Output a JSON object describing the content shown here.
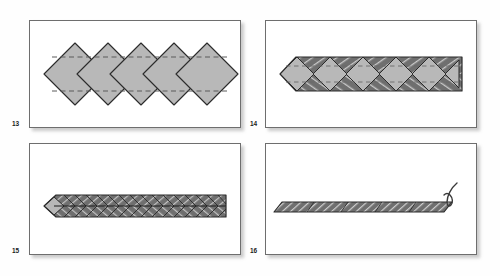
{
  "document": {
    "type": "origami-folding-instruction-diagram",
    "title": "",
    "background_color": "#fdfdfd"
  },
  "palette": {
    "paper_face": "#b8b8b8",
    "paper_face_light": "#c3c3c3",
    "paper_shadow": "#8f8f8f",
    "hatch_dark": "#6f6f6f",
    "hatch_line": "#2b2b2b",
    "outline": "#2b2b2b",
    "frame_border": "#6e6e6e",
    "frame_fill": "#ffffff",
    "fold_line": "#5a5a5a",
    "annotation_ink": "#3a3a3a"
  },
  "panels": [
    {
      "id": "panel-13",
      "number": "13",
      "caption": "",
      "content_name": "diamond-strip-unfolded",
      "description_shape": "row of five overlapping squares rotated 45 degrees with two horizontal dashed fold lines",
      "unit_count": 5,
      "fold_lines": 2,
      "fold_line_style": "dashed",
      "fill_color": "#b8b8b8",
      "outline_color": "#2b2b2b"
    },
    {
      "id": "panel-14",
      "number": "14",
      "caption": "",
      "content_name": "diamond-strip-edges-folded",
      "description_shape": "same strip with top and bottom corners folded inward showing dark hatched flaps",
      "unit_count": 5,
      "fold_lines": 2,
      "fold_line_style": "dashed",
      "fill_color": "#b8b8b8",
      "hatch_color": "#6f6f6f",
      "outline_color": "#2b2b2b"
    },
    {
      "id": "panel-15",
      "number": "15",
      "caption": "",
      "content_name": "chevron-strip-folded",
      "description_shape": "narrow horizontal band of chevron shaped hatched segments with pointed left tip",
      "unit_count": 5,
      "chevrons_per_unit": 4,
      "fill_color": "#9e9e9e",
      "hatch_color": "#6f6f6f",
      "outline_color": "#2b2b2b"
    },
    {
      "id": "panel-16",
      "number": "16",
      "caption": "",
      "content_name": "flat-hatched-strip",
      "description_shape": "thin flat parallelogram strip filled with diagonal hatching",
      "unit_count": 5,
      "hatch_color": "#6f6f6f",
      "outline_color": "#2b2b2b"
    }
  ],
  "annotations": [
    {
      "name": "handwritten-mark",
      "text": "6",
      "style": "handwritten-pen-stroke",
      "panel": "panel-16",
      "position": "upper-right"
    }
  ]
}
